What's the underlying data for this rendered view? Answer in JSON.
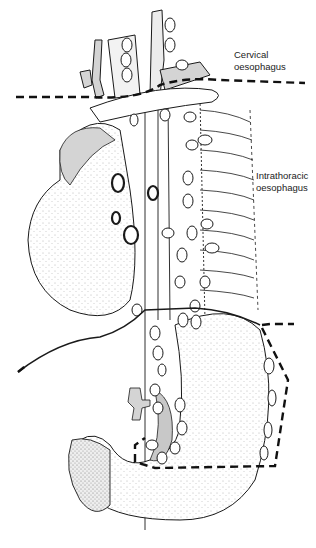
{
  "figure": {
    "type": "anatomical-illustration",
    "labels": {
      "cervical": {
        "line1": "Cervical",
        "line2": "oesophagus"
      },
      "intrathoracic": {
        "line1": "Intrathoracic",
        "line2": "oesophagus"
      }
    },
    "colors": {
      "background": "#ffffff",
      "ink": "#1a1a1a",
      "shade": "#d4d4d4",
      "dashed_line": "#111111"
    }
  }
}
